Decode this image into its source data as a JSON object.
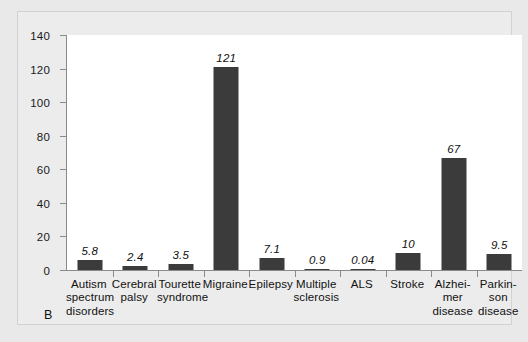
{
  "panel": {
    "label": "B"
  },
  "chart_data": {
    "type": "bar",
    "title": "",
    "xlabel": "",
    "ylabel": "",
    "ylim": [
      0,
      140
    ],
    "yticks": [
      0,
      20,
      40,
      60,
      80,
      100,
      120,
      140
    ],
    "grid": false,
    "legend": null,
    "bar_color": "#3b3b3b",
    "plot_background": "#ffffff",
    "figure_background": "#e9e9e9",
    "value_label_style": "italic",
    "categories": [
      "Autism spectrum disorders",
      "Cerebral palsy",
      "Tourette syndrome",
      "Migraine",
      "Epilepsy",
      "Multiple sclerosis",
      "ALS",
      "Stroke",
      "Alzheimer disease",
      "Parkinson disease"
    ],
    "category_lines": [
      [
        "Autism",
        "spectrum",
        "disorders"
      ],
      [
        "Cerebral",
        "palsy"
      ],
      [
        "Tourette",
        "syndrome"
      ],
      [
        "Migraine"
      ],
      [
        "Epilepsy"
      ],
      [
        "Multiple",
        "sclerosis"
      ],
      [
        "ALS"
      ],
      [
        "Stroke"
      ],
      [
        "Alzhei-",
        "mer",
        "disease"
      ],
      [
        "Parkin-",
        "son",
        "disease"
      ]
    ],
    "values": [
      5.8,
      2.4,
      3.5,
      121,
      7.1,
      0.9,
      0.04,
      10,
      67,
      9.5
    ],
    "value_labels": [
      "5.8",
      "2.4",
      "3.5",
      "121",
      "7.1",
      "0.9",
      "0.04",
      "10",
      "67",
      "9.5"
    ]
  }
}
